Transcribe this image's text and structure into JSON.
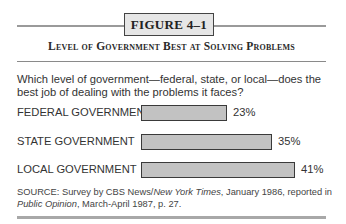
{
  "figure": {
    "label": "FIGURE 4–1",
    "title": "Level of Government Best at Solving Problems",
    "question": "Which level of government—federal, state, or local—does the best job of dealing with the problems it faces?",
    "source": {
      "prefix": "SOURCE: Survey by CBS News/",
      "italic1": "New York Times",
      "middle": ", January 1986, reported in ",
      "italic2": "Public Opinion",
      "suffix": ", March-April 1987, p. 27."
    },
    "colors": {
      "bar_fill": "#c2c2c2",
      "bar_border": "#3a3a3a",
      "box_fill": "#e6e6e6",
      "rule": "#9a9a9a"
    }
  },
  "chart_data": {
    "type": "bar",
    "orientation": "horizontal",
    "title": "Level of Government Best at Solving Problems",
    "subtitle": "Which level of government—federal, state, or local—does the best job of dealing with the problems it faces?",
    "categories": [
      "FEDERAL GOVERNMENT",
      "STATE GOVERNMENT",
      "LOCAL GOVERNMENT"
    ],
    "values": [
      23,
      35,
      41
    ],
    "value_labels": [
      "23%",
      "35%",
      "41%"
    ],
    "unit": "%",
    "xlabel": "",
    "ylabel": "",
    "grid": false,
    "legend": null
  }
}
